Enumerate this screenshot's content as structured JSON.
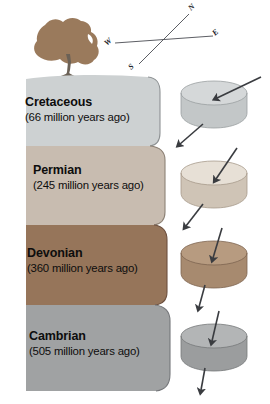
{
  "figure": {
    "background_color": "#ffffff"
  },
  "compass": {
    "name": "compass-rose",
    "rotation_deg": -25,
    "directions": [
      {
        "label": "N",
        "position": "upper-right"
      },
      {
        "label": "S",
        "position": "lower-left"
      },
      {
        "label": "W",
        "position": "left"
      },
      {
        "label": "E",
        "position": "right"
      }
    ]
  },
  "tree": {
    "name": "tree",
    "foliage_color": "#9a7a5c",
    "trunk_color": "#6b6156"
  },
  "strata": [
    {
      "period": "Cretaceous",
      "age": "(66 million years ago)",
      "color": "#cdd1d2",
      "sample_color": "#c3c7c8",
      "sample_top_color": "#d5d8d9",
      "arrow_angle_deg": 38
    },
    {
      "period": "Permian",
      "age": "(245 million years ago)",
      "color": "#c8bcb0",
      "sample_color": "#cfc4b6",
      "sample_top_color": "#e7e0d6",
      "arrow_angle_deg": 22
    },
    {
      "period": "Devonian",
      "age": "(360 million years ago)",
      "color": "#96755a",
      "sample_color": "#a78a6f",
      "sample_top_color": "#b79b80",
      "arrow_angle_deg": 12
    },
    {
      "period": "Cambrian",
      "age": "(505 million years ago)",
      "color": "#a0a2a3",
      "sample_color": "#9b9d9e",
      "sample_top_color": "#b3b5b6",
      "arrow_angle_deg": 8
    }
  ]
}
